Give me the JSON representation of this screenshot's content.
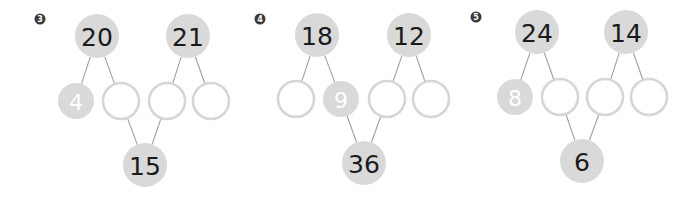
{
  "problems": [
    {
      "number": "3",
      "top": [
        "20",
        "21"
      ],
      "middle": [
        "4",
        "",
        "",
        ""
      ],
      "bottom": "15"
    },
    {
      "number": "4",
      "top": [
        "18",
        "12"
      ],
      "middle": [
        "",
        "9",
        "",
        ""
      ],
      "bottom": "36"
    },
    {
      "number": "5",
      "top": [
        "24",
        "14"
      ],
      "middle": [
        "8",
        "",
        "",
        ""
      ],
      "bottom": "6"
    }
  ],
  "colors": {
    "filled_circle": "#d9d9d9",
    "empty_circle_stroke": "#d6d6d6",
    "connector": "#a0a0a0",
    "badge": "#3a3a3a"
  }
}
